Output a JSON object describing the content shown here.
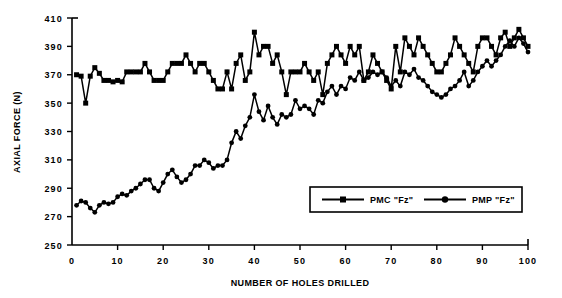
{
  "chart_data": {
    "type": "line",
    "title": "",
    "xlabel": "NUMBER OF HOLES DRILLED",
    "ylabel": "AXIAL FORCE (N)",
    "xlim": [
      0,
      100
    ],
    "ylim": [
      250,
      410
    ],
    "ytick_step": 20,
    "xtick_step": 10,
    "grid": false,
    "legend_position": "inside-bottom-right",
    "xticks": [
      "0",
      "10",
      "20",
      "30",
      "40",
      "50",
      "60",
      "70",
      "80",
      "90",
      "100"
    ],
    "yticks": [
      "250",
      "270",
      "290",
      "310",
      "330",
      "350",
      "370",
      "390",
      "410"
    ],
    "x": [
      1,
      2,
      3,
      4,
      5,
      6,
      7,
      8,
      9,
      10,
      11,
      12,
      13,
      14,
      15,
      16,
      17,
      18,
      19,
      20,
      21,
      22,
      23,
      24,
      25,
      26,
      27,
      28,
      29,
      30,
      31,
      32,
      33,
      34,
      35,
      36,
      37,
      38,
      39,
      40,
      41,
      42,
      43,
      44,
      45,
      46,
      47,
      48,
      49,
      50,
      51,
      52,
      53,
      54,
      55,
      56,
      57,
      58,
      59,
      60,
      61,
      62,
      63,
      64,
      65,
      66,
      67,
      68,
      69,
      70,
      71,
      72,
      73,
      74,
      75,
      76,
      77,
      78,
      79,
      80,
      81,
      82,
      83,
      84,
      85,
      86,
      87,
      88,
      89,
      90,
      91,
      92,
      93,
      94,
      95,
      96,
      97,
      98,
      99,
      100
    ],
    "series": [
      {
        "name": "PMC  \"Fz\"",
        "marker": "square",
        "color": "#000000",
        "values": [
          370,
          369,
          350,
          369,
          375,
          371,
          366,
          366,
          365,
          366,
          365,
          372,
          372,
          372,
          372,
          378,
          372,
          366,
          366,
          366,
          372,
          378,
          378,
          378,
          384,
          378,
          372,
          378,
          378,
          372,
          366,
          360,
          360,
          372,
          360,
          378,
          384,
          366,
          372,
          400,
          384,
          390,
          390,
          378,
          384,
          372,
          356,
          372,
          372,
          372,
          378,
          372,
          366,
          372,
          356,
          378,
          384,
          390,
          384,
          378,
          390,
          384,
          390,
          366,
          372,
          384,
          378,
          372,
          366,
          360,
          390,
          372,
          396,
          390,
          384,
          396,
          390,
          384,
          378,
          372,
          372,
          378,
          384,
          396,
          390,
          384,
          378,
          372,
          390,
          396,
          396,
          390,
          384,
          396,
          400,
          390,
          396,
          402,
          396,
          390
        ]
      },
      {
        "name": "PMP  \"Fz\"",
        "marker": "circle",
        "color": "#000000",
        "values": [
          278,
          281,
          280,
          276,
          273,
          278,
          280,
          279,
          280,
          284,
          286,
          285,
          288,
          290,
          293,
          296,
          296,
          290,
          288,
          294,
          300,
          303,
          298,
          294,
          296,
          300,
          306,
          306,
          310,
          308,
          304,
          306,
          306,
          310,
          322,
          330,
          325,
          334,
          340,
          356,
          344,
          338,
          348,
          340,
          335,
          342,
          340,
          342,
          352,
          346,
          348,
          346,
          342,
          352,
          350,
          358,
          362,
          356,
          362,
          360,
          368,
          366,
          372,
          366,
          368,
          372,
          370,
          372,
          368,
          362,
          366,
          362,
          372,
          370,
          374,
          368,
          366,
          362,
          358,
          356,
          354,
          356,
          360,
          362,
          366,
          372,
          362,
          366,
          372,
          376,
          380,
          376,
          380,
          384,
          390,
          394,
          390,
          396,
          392,
          386
        ]
      }
    ]
  },
  "legend": {
    "entries": [
      {
        "label": "PMC  \"Fz\"",
        "marker": "square"
      },
      {
        "label": "PMP  \"Fz\"",
        "marker": "circle"
      }
    ]
  }
}
